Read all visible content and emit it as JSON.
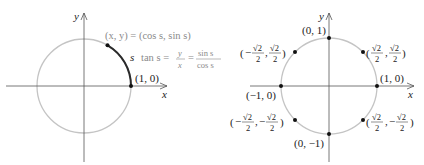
{
  "figure_left": {
    "axis_labels": {
      "x": "x",
      "y": "y"
    },
    "point_label": "(1, 0)",
    "arc_label": "s",
    "point_formula": "(x, y) = (cos s, sin s)",
    "tan_formula": {
      "lhs": "tan s =",
      "frac1_num": "y",
      "frac1_den": "x",
      "eq": "=",
      "frac2_num": "sin s",
      "frac2_den": "cos s"
    },
    "colors": {
      "circle": "#c4c4c4",
      "arc": "#2a2a2a",
      "axis": "#555555",
      "gray_text": "#8a8a8a"
    }
  },
  "figure_right": {
    "axis_labels": {
      "x": "x",
      "y": "y"
    },
    "points": [
      {
        "label": "(1, 0)"
      },
      {
        "label": "(0, 1)"
      },
      {
        "label": "(−1, 0)"
      },
      {
        "label": "(0, −1)"
      },
      {
        "label_num_x": "√2",
        "label_den_x": "2",
        "label_num_y": "√2",
        "label_den_y": "2",
        "sign_x": "",
        "sign_y": ""
      },
      {
        "label_num_x": "√2",
        "label_den_x": "2",
        "label_num_y": "√2",
        "label_den_y": "2",
        "sign_x": "−",
        "sign_y": ""
      },
      {
        "label_num_x": "√2",
        "label_den_x": "2",
        "label_num_y": "√2",
        "label_den_y": "2",
        "sign_x": "−",
        "sign_y": "−"
      },
      {
        "label_num_x": "√2",
        "label_den_x": "2",
        "label_num_y": "√2",
        "label_den_y": "2",
        "sign_x": "",
        "sign_y": "−"
      }
    ]
  }
}
